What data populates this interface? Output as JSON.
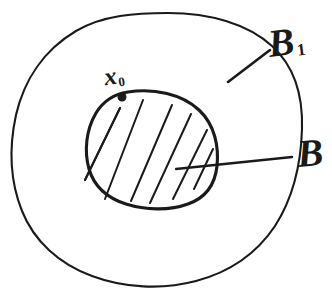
{
  "figure": {
    "kind": "hand-drawn-set-diagram",
    "background_color": "#ffffff",
    "ink_color": "#1a1a18",
    "width": 332,
    "height": 293
  },
  "labels": {
    "outer_region": {
      "text": "B",
      "subscript": "1",
      "full": "B1",
      "meaning": "outer-set-label"
    },
    "inner_region": {
      "text": "B",
      "subscript": "",
      "full": "B",
      "meaning": "inner-hatched-set-label"
    },
    "point": {
      "text": "x",
      "subscript": "0",
      "full": "x0",
      "meaning": "marked-boundary-point-label"
    }
  },
  "shapes": {
    "outer_region": {
      "name": "outer-blob",
      "stroke_width": 2.1,
      "filled": false,
      "path": "M 168 13 C 210 13 248 24 272 46 C 294 66 303 96 302 129 C 301 163 293 198 275 226 C 257 253 230 272 196 281 C 162 290 124 288 92 276 C 59 264 34 241 22 211 C 10 181 9 147 16 115 C 24 80 44 50 76 31 C 103 15 136 13 168 13 Z"
    },
    "inner_region": {
      "name": "inner-hatched-blob",
      "stroke_width": 3.1,
      "filled": false,
      "hatched": true,
      "path": "M 128 92 C 154 88 182 94 199 110 C 215 125 219 147 217 166 C 215 185 205 198 188 204 C 169 211 145 210 126 204 C 107 198 94 186 89 169 C 84 151 86 130 96 113 C 104 100 114 94 128 92 Z"
    },
    "hatch_lines": [
      {
        "name": "hatch-1",
        "x1": 85,
        "y1": 180,
        "x2": 120,
        "y2": 108
      },
      {
        "name": "hatch-2",
        "x1": 105,
        "y1": 199,
        "x2": 143,
        "y2": 100
      },
      {
        "name": "hatch-3",
        "x1": 131,
        "y1": 201,
        "x2": 172,
        "y2": 105
      },
      {
        "name": "hatch-4",
        "x1": 150,
        "y1": 203,
        "x2": 191,
        "y2": 114
      },
      {
        "name": "hatch-5",
        "x1": 173,
        "y1": 199,
        "x2": 207,
        "y2": 130
      },
      {
        "name": "hatch-6",
        "x1": 194,
        "y1": 189,
        "x2": 213,
        "y2": 149
      }
    ],
    "point_marker": {
      "name": "point-x0-dot",
      "cx": 122,
      "cy": 97,
      "r": 3.9
    },
    "leader_outer": {
      "name": "leader-line-to-outer-region",
      "x1": 228,
      "y1": 82,
      "x2": 270,
      "y2": 50
    },
    "leader_inner": {
      "name": "leader-line-to-inner-region",
      "x1": 176,
      "y1": 169,
      "x2": 292,
      "y2": 157
    }
  }
}
